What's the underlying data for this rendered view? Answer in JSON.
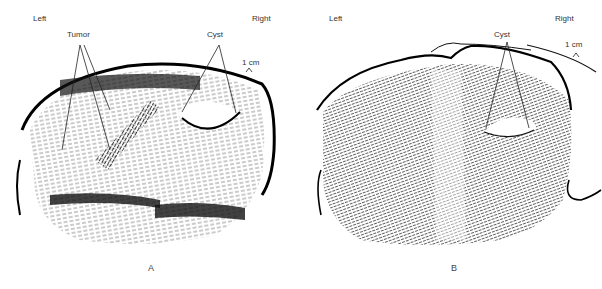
{
  "figure": {
    "panels": [
      {
        "id": "A",
        "caption": "A",
        "left_label": "Left",
        "right_label": "Right",
        "annotations": [
          "Tumor",
          "Cyst"
        ],
        "scale_label": "1 cm"
      },
      {
        "id": "B",
        "caption": "B",
        "left_label": "Left",
        "right_label": "Right",
        "annotations": [
          "Cyst"
        ],
        "scale_label": "1 cm"
      }
    ]
  }
}
